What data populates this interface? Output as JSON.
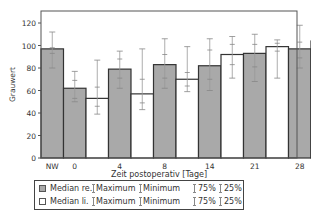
{
  "chart_data": {
    "type": "bar",
    "title": "",
    "xlabel": "Zeit postoperativ [Tage]",
    "ylabel": "Grauwert",
    "ylim": [
      0,
      130
    ],
    "yticks": [
      0,
      20,
      40,
      60,
      80,
      100,
      120
    ],
    "categories": [
      "NW",
      "0",
      "4",
      "8",
      "14",
      "21",
      "28",
      "42",
      "84"
    ],
    "grid": false,
    "legend_position": "bottom",
    "series": [
      {
        "name": "Median re.",
        "fill": "#a9a9a9",
        "values": [
          97,
          62,
          79,
          83,
          82,
          93,
          97,
          99,
          97
        ],
        "maximum": [
          112,
          77,
          95,
          106,
          106,
          110,
          118,
          130,
          98
        ],
        "q75": [
          98,
          69,
          88,
          92,
          96,
          101,
          103,
          110,
          98
        ],
        "q25": [
          93,
          53,
          71,
          71,
          70,
          81,
          89,
          90,
          96
        ],
        "minimum": [
          80,
          50,
          62,
          62,
          60,
          68,
          80,
          84,
          95
        ]
      },
      {
        "name": "Median li.",
        "fill": "#ffffff",
        "values": [
          null,
          53,
          57,
          70,
          92,
          99,
          104,
          98,
          93
        ],
        "maximum": [
          null,
          87,
          97,
          99,
          108,
          105,
          120,
          116,
          99
        ],
        "q75": [
          null,
          63,
          70,
          76,
          101,
          102,
          112,
          111,
          97
        ],
        "q25": [
          null,
          46,
          49,
          64,
          83,
          95,
          95,
          86,
          89
        ],
        "minimum": [
          null,
          39,
          43,
          59,
          71,
          71,
          63,
          70,
          88
        ]
      }
    ]
  },
  "legend": {
    "rows": [
      {
        "swatch": "grey",
        "label": "Median re.",
        "maximum": "Maximum",
        "minimum": "Minimum",
        "q75": "75%",
        "q25": "25%"
      },
      {
        "swatch": "white",
        "label": "Median li.",
        "maximum": "Maximum",
        "minimum": "Minimum",
        "q75": "75%",
        "q25": "25%"
      }
    ]
  }
}
